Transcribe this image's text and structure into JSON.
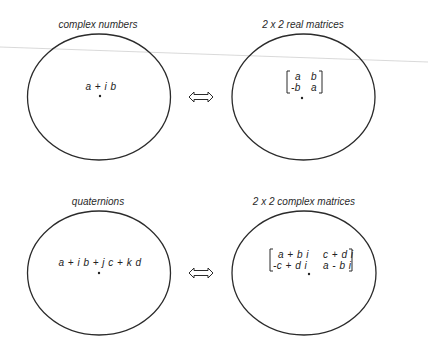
{
  "diagram": {
    "nodes": [
      {
        "id": "complex_numbers",
        "label": "complex numbers",
        "element": "a + i b",
        "shape": "ellipse",
        "center": [
          99,
          97
        ]
      },
      {
        "id": "real_matrices",
        "label": "2 x 2 real matrices",
        "element_matrix": [
          [
            "a",
            "b"
          ],
          [
            "-b",
            "a"
          ]
        ],
        "shape": "ellipse",
        "center": [
          303,
          97
        ]
      },
      {
        "id": "quaternions",
        "label": "quaternions",
        "element": "a + i b + j c + k d",
        "shape": "ellipse",
        "center": [
          99,
          273
        ]
      },
      {
        "id": "complex_matrices",
        "label": "2 x 2 complex matrices",
        "element_matrix": [
          [
            "a + b i",
            "c + d i"
          ],
          [
            "-c + d i",
            "a - b i"
          ]
        ],
        "shape": "ellipse",
        "center": [
          304,
          273
        ]
      }
    ],
    "edges": [
      {
        "from": "complex_numbers",
        "to": "real_matrices",
        "type": "double-arrow",
        "symbol": "⇔"
      },
      {
        "from": "quaternions",
        "to": "complex_matrices",
        "type": "double-arrow",
        "symbol": "⇔"
      }
    ],
    "colors": {
      "stroke": "#2b2b2b",
      "text": "#222222",
      "scan_line": "#c8c8c8",
      "background": "#ffffff"
    }
  }
}
